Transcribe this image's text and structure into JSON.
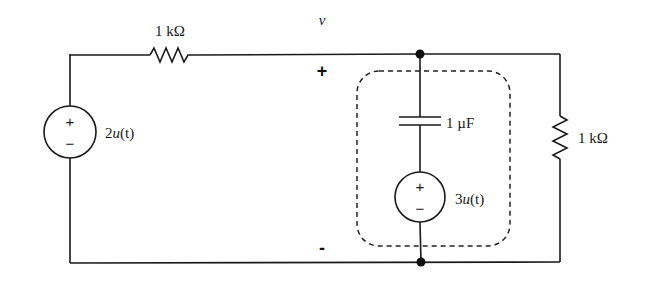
{
  "circuit": {
    "top_resistor": {
      "label": "1 kΩ"
    },
    "left_source": {
      "value_prefix": "2",
      "func": "u",
      "arg": "(t)",
      "plus": "+",
      "minus": "−"
    },
    "node_voltage": {
      "name": "v",
      "plus": "+",
      "minus": "-"
    },
    "capacitor": {
      "label": "1 µF"
    },
    "inner_source": {
      "value_prefix": "3",
      "func": "u",
      "arg": "(t)",
      "plus": "+",
      "minus": "−"
    },
    "right_resistor": {
      "label": "1 kΩ"
    }
  },
  "colors": {
    "line": "#1a1a1a",
    "background": "#ffffff"
  }
}
